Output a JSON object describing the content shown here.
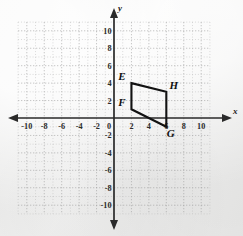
{
  "figure": {
    "background_color": "#efefee",
    "axis_color": "#2a2a2a",
    "grid_color": "#b9b9b9",
    "shape_color": "#121212"
  },
  "chart_data": {
    "type": "scatter",
    "title": "",
    "xlabel": "x",
    "ylabel": "y",
    "xlim": [
      -11,
      11
    ],
    "ylim": [
      -11,
      11
    ],
    "grid": true,
    "grid_step": 1,
    "tick_step": 2,
    "legend": "none",
    "xticks": [
      -10,
      -8,
      -6,
      -4,
      -2,
      0,
      2,
      4,
      6,
      8,
      10
    ],
    "xtick_labels": [
      "-10",
      "-8",
      "-6",
      "-4",
      "-2",
      "0",
      "2",
      "4",
      "6",
      "8",
      "10"
    ],
    "yticks": [
      10,
      8,
      6,
      4,
      2,
      0,
      -2,
      -4,
      -6,
      -8,
      -10
    ],
    "ytick_labels": [
      "10",
      "8",
      "6",
      "4",
      "2",
      "0",
      "-2",
      "-4",
      "-6",
      "-8",
      "-10"
    ],
    "shapes": [
      {
        "name": "EFGH",
        "kind": "parallelogram",
        "closed": true,
        "vertices": [
          {
            "label": "E",
            "x": 2,
            "y": 4,
            "label_pos": "upper-left"
          },
          {
            "label": "H",
            "x": 6,
            "y": 3,
            "label_pos": "upper-right"
          },
          {
            "label": "G",
            "x": 6,
            "y": -1,
            "label_pos": "lower-right"
          },
          {
            "label": "F",
            "x": 2,
            "y": 1,
            "label_pos": "upper-left"
          }
        ]
      }
    ]
  },
  "labels": {
    "x_axis": "x",
    "y_axis": "y",
    "vertex_e": "E",
    "vertex_f": "F",
    "vertex_g": "G",
    "vertex_h": "H"
  },
  "ticks": {
    "x": [
      "-10",
      "-8",
      "-6",
      "-4",
      "-2",
      "0",
      "2",
      "4",
      "6",
      "8",
      "10"
    ],
    "y_top": [
      "10",
      "8",
      "6",
      "4",
      "2"
    ],
    "y_bottom": [
      "-2",
      "-4",
      "-6",
      "-8",
      "-10"
    ]
  }
}
